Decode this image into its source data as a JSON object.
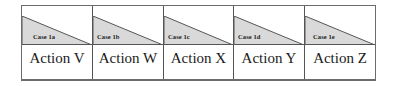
{
  "diagram": {
    "colors": {
      "border": "#555555",
      "triangle_fill": "#d9d9d9",
      "background": "#ffffff",
      "text": "#1a1a1a"
    },
    "columns": [
      {
        "case": "Case 1a",
        "action": "Action V"
      },
      {
        "case": "Case 1b",
        "action": "Action W"
      },
      {
        "case": "Case 1c",
        "action": "Action X"
      },
      {
        "case": "Case 1d",
        "action": "Action Y"
      },
      {
        "case": "Case 1e",
        "action": "Action Z"
      }
    ]
  }
}
